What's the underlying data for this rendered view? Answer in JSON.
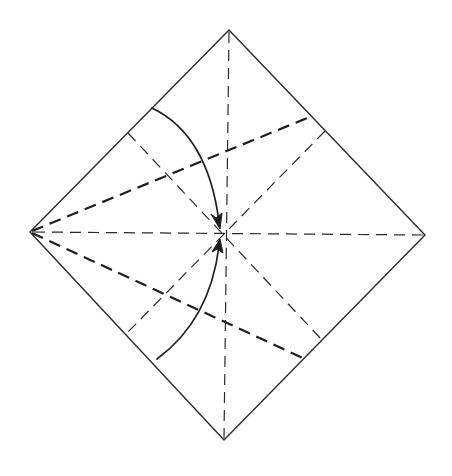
{
  "diagram": {
    "type": "origami-crease-pattern",
    "colors": {
      "line": "#2a2a2a",
      "background": "#ffffff"
    },
    "vertices": {
      "top": [
        229,
        30
      ],
      "right": [
        425,
        235
      ],
      "bottom": [
        224,
        440
      ],
      "left": [
        30,
        232
      ],
      "center": [
        226,
        235
      ]
    },
    "creases": [
      {
        "id": "vertical-diagonal",
        "style": "dashed",
        "from": [
          229,
          30
        ],
        "to": [
          224,
          440
        ]
      },
      {
        "id": "horizontal-diagonal",
        "style": "dashed",
        "from": [
          30,
          232
        ],
        "to": [
          425,
          235
        ]
      },
      {
        "id": "upper-bisector-fold",
        "style": "bold-dashed",
        "from": [
          30,
          232
        ],
        "to": [
          312,
          116
        ]
      },
      {
        "id": "lower-bisector-fold",
        "style": "bold-dashed",
        "from": [
          30,
          232
        ],
        "to": [
          305,
          359
        ]
      },
      {
        "id": "midline-nw-se",
        "style": "dashed",
        "from": [
          128,
          133
        ],
        "to": [
          322,
          340
        ]
      },
      {
        "id": "midline-ne-sw",
        "style": "dashed",
        "from": [
          325,
          131
        ],
        "to": [
          128,
          332
        ]
      }
    ],
    "arrows": [
      {
        "id": "upper-fold-arrow",
        "from": [
          152,
          108
        ],
        "to": [
          220,
          228
        ],
        "meaning": "fold upper-left edge to center"
      },
      {
        "id": "lower-fold-arrow",
        "from": [
          157,
          359
        ],
        "to": [
          220,
          240
        ],
        "meaning": "fold lower-left edge to center"
      }
    ]
  }
}
